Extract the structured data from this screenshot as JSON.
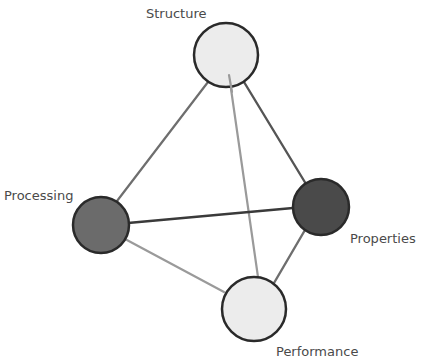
{
  "diagram": {
    "type": "tetrahedron",
    "title": "",
    "colors": {
      "background": "#ffffff",
      "node_stroke": "#2a2a2a",
      "label_text": "#4a4a4a",
      "edge_dark": "#3a3a3a",
      "edge_medium": "#6e6e6e",
      "edge_light": "#9a9a9a"
    },
    "nodes": [
      {
        "id": "structure",
        "label": "Structure",
        "cx": 226,
        "cy": 55,
        "r": 32,
        "fill": "#ececec"
      },
      {
        "id": "processing",
        "label": "Processing",
        "cx": 101,
        "cy": 225,
        "r": 28,
        "fill": "#6b6b6b"
      },
      {
        "id": "properties",
        "label": "Properties",
        "cx": 321,
        "cy": 207,
        "r": 28,
        "fill": "#4a4a4a"
      },
      {
        "id": "performance",
        "label": "Performance",
        "cx": 254,
        "cy": 309,
        "r": 32,
        "fill": "#ececec"
      }
    ],
    "edges": [
      {
        "from": "structure",
        "to": "processing",
        "x1": 208,
        "y1": 82,
        "x2": 117,
        "y2": 201,
        "color": "#6e6e6e",
        "width": 2.2
      },
      {
        "from": "structure",
        "to": "properties",
        "x1": 244,
        "y1": 82,
        "x2": 306,
        "y2": 184,
        "color": "#555555",
        "width": 2.4
      },
      {
        "from": "structure",
        "to": "performance",
        "x1": 229,
        "y1": 75,
        "x2": 258,
        "y2": 277,
        "color": "#9a9a9a",
        "width": 2.2
      },
      {
        "from": "processing",
        "to": "properties",
        "x1": 128,
        "y1": 223,
        "x2": 293,
        "y2": 208,
        "color": "#3a3a3a",
        "width": 2.6
      },
      {
        "from": "processing",
        "to": "performance",
        "x1": 125,
        "y1": 239,
        "x2": 224,
        "y2": 292,
        "color": "#9a9a9a",
        "width": 2.2
      },
      {
        "from": "properties",
        "to": "performance",
        "x1": 305,
        "y1": 230,
        "x2": 274,
        "y2": 283,
        "color": "#6e6e6e",
        "width": 2.4
      }
    ],
    "labels": [
      {
        "node": "structure",
        "text": "Structure",
        "x": 146,
        "y": 18
      },
      {
        "node": "processing",
        "text": "Processing",
        "x": 4,
        "y": 200
      },
      {
        "node": "properties",
        "text": "Properties",
        "x": 350,
        "y": 243
      },
      {
        "node": "performance",
        "text": "Performance",
        "x": 276,
        "y": 356
      }
    ]
  }
}
